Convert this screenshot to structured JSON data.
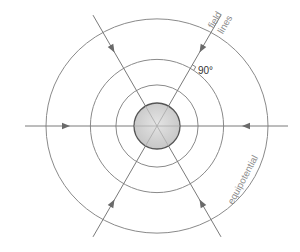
{
  "diagram": {
    "central_body": {
      "label": "charged sphere",
      "fill_color": "#cfcfcf",
      "stroke_color": "#555555"
    },
    "equipotentials": {
      "count": 3,
      "relative_radii": [
        0.37,
        0.6,
        1.0
      ],
      "color": "#8a8a8a"
    },
    "field_lines": {
      "count": 6,
      "angles_deg": [
        0,
        60,
        120,
        180,
        240,
        300
      ],
      "direction": "inward",
      "color": "#7a7a7a"
    },
    "labels": {
      "field_lines_word1": "field",
      "field_lines_word2": "lines",
      "equipotential": "equipotential",
      "right_angle": "90°"
    }
  }
}
